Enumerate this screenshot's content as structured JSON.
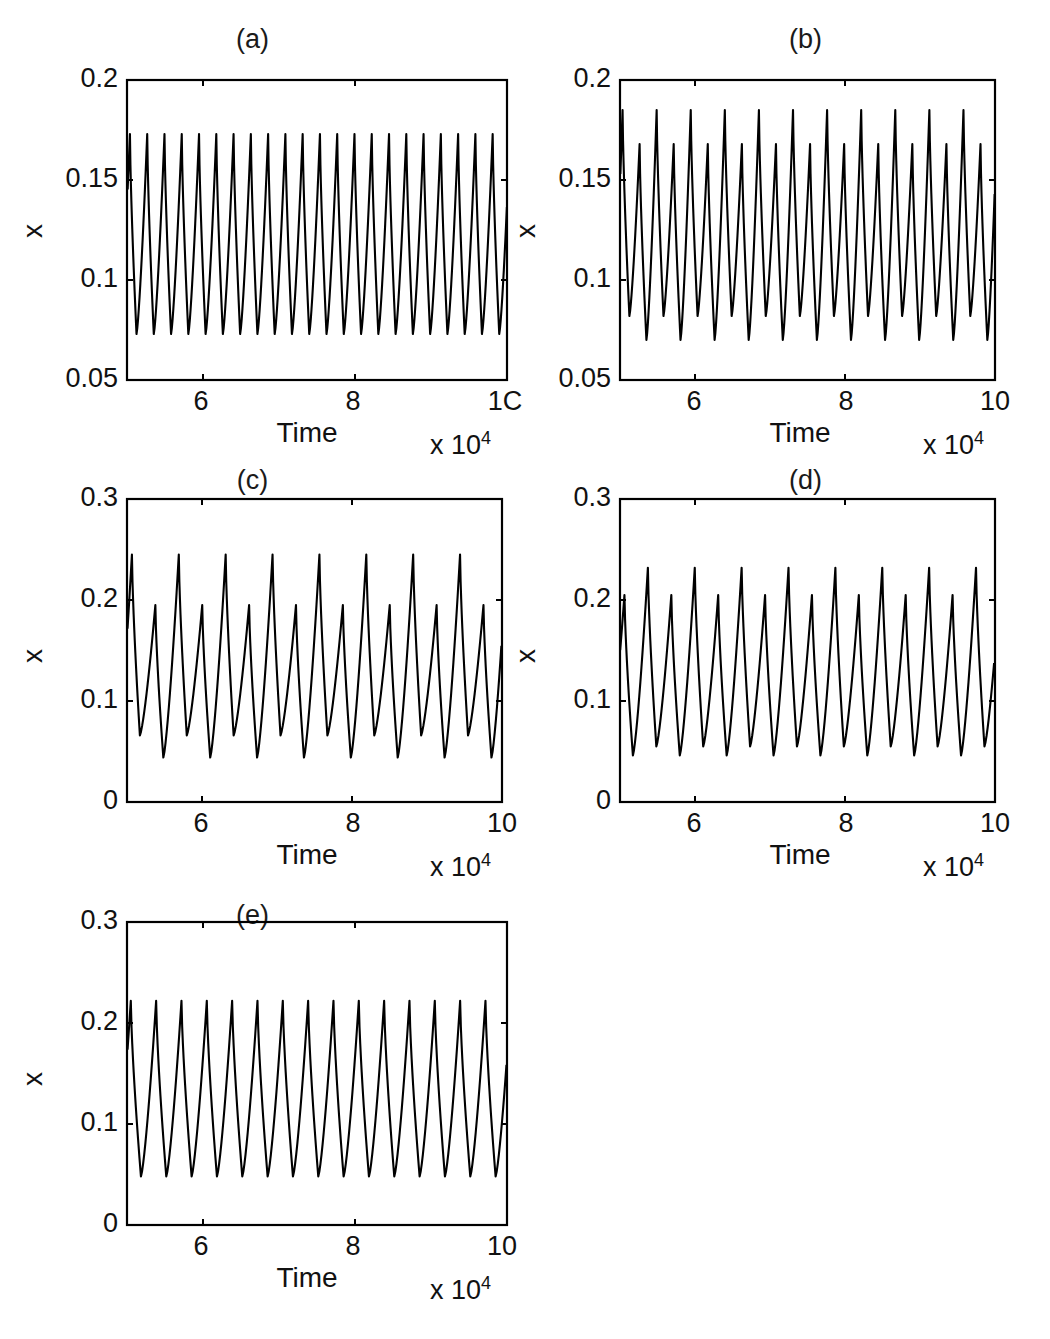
{
  "figure": {
    "background_color": "#ffffff",
    "line_color": "#000000",
    "axis_color": "#000000"
  },
  "panels": [
    {
      "id": "a",
      "title": "(a)",
      "xlabel": "Time",
      "ylabel": "x",
      "exponent_text": "x 10",
      "exponent_sup": "4",
      "xticks": [
        "6",
        "8",
        "1C"
      ],
      "yticks": [
        "0.2",
        "0.15",
        "0.1",
        "0.05"
      ]
    },
    {
      "id": "b",
      "title": "(b)",
      "xlabel": "Time",
      "ylabel": "x",
      "exponent_text": "x 10",
      "exponent_sup": "4",
      "xticks": [
        "6",
        "8",
        "10"
      ],
      "yticks": [
        "0.2",
        "0.15",
        "0.1",
        "0.05"
      ]
    },
    {
      "id": "c",
      "title": "(c)",
      "xlabel": "Time",
      "ylabel": "x",
      "exponent_text": "x 10",
      "exponent_sup": "4",
      "xticks": [
        "6",
        "8",
        "10"
      ],
      "yticks": [
        "0.3",
        "0.2",
        "0.1",
        "0"
      ]
    },
    {
      "id": "d",
      "title": "(d)",
      "xlabel": "Time",
      "ylabel": "x",
      "exponent_text": "x 10",
      "exponent_sup": "4",
      "xticks": [
        "6",
        "8",
        "10"
      ],
      "yticks": [
        "0.3",
        "0.2",
        "0.1",
        "0"
      ]
    },
    {
      "id": "e",
      "title": "(e)",
      "xlabel": "Time",
      "ylabel": "x",
      "exponent_text": "x 10",
      "exponent_sup": "4",
      "xticks": [
        "6",
        "8",
        "10"
      ],
      "yticks": [
        "0.3",
        "0.2",
        "0.1",
        "0"
      ]
    }
  ],
  "chart_data": [
    {
      "type": "line",
      "panel": "a",
      "title": "(a)",
      "xlabel": "Time",
      "ylabel": "x",
      "x_scale_exponent": 4,
      "xlim": [
        5,
        10
      ],
      "ylim": [
        0.05,
        0.2
      ],
      "xticks": [
        6,
        8,
        10
      ],
      "yticks": [
        0.05,
        0.1,
        0.15,
        0.2
      ],
      "grid": false,
      "legend": "none",
      "waveform": "periodic-relaxation",
      "periodicity": "period-1",
      "n_cycles": 22,
      "period_units": 0.2273,
      "peak_values": [
        0.173
      ],
      "trough_values": [
        0.073
      ],
      "rise_fraction": 0.62,
      "description": "Uniform period-1 relaxation oscillation, peaks 0.173, troughs 0.073"
    },
    {
      "type": "line",
      "panel": "b",
      "title": "(b)",
      "xlabel": "Time",
      "ylabel": "x",
      "x_scale_exponent": 4,
      "xlim": [
        5,
        10
      ],
      "ylim": [
        0.05,
        0.2
      ],
      "xticks": [
        6,
        8,
        10
      ],
      "yticks": [
        0.05,
        0.1,
        0.15,
        0.2
      ],
      "grid": false,
      "legend": "none",
      "waveform": "periodic-relaxation",
      "periodicity": "period-2",
      "n_cycles": 22,
      "period_units": 0.2273,
      "peak_values": [
        0.185,
        0.168
      ],
      "trough_values": [
        0.07,
        0.082
      ],
      "rise_fraction": 0.6,
      "description": "Period-2 alternation: tall peaks 0.185, short peaks 0.168"
    },
    {
      "type": "line",
      "panel": "c",
      "title": "(c)",
      "xlabel": "Time",
      "ylabel": "x",
      "x_scale_exponent": 4,
      "xlim": [
        5,
        10
      ],
      "ylim": [
        0,
        0.3
      ],
      "xticks": [
        6,
        8,
        10
      ],
      "yticks": [
        0,
        0.1,
        0.2,
        0.3
      ],
      "grid": false,
      "legend": "none",
      "waveform": "periodic-relaxation",
      "periodicity": "period-2",
      "n_cycles": 16,
      "period_units": 0.3125,
      "peak_values": [
        0.245,
        0.195
      ],
      "trough_values": [
        0.044,
        0.066
      ],
      "rise_fraction": 0.66,
      "description": "Strong period-2 alternation: tall peaks 0.245, short peaks 0.195"
    },
    {
      "type": "line",
      "panel": "d",
      "title": "(d)",
      "xlabel": "Time",
      "ylabel": "x",
      "x_scale_exponent": 4,
      "xlim": [
        5,
        10
      ],
      "ylim": [
        0,
        0.3
      ],
      "xticks": [
        6,
        8,
        10
      ],
      "yticks": [
        0,
        0.1,
        0.2,
        0.3
      ],
      "grid": false,
      "legend": "none",
      "waveform": "periodic-relaxation",
      "periodicity": "period-2",
      "n_cycles": 16,
      "period_units": 0.3125,
      "peak_values": [
        0.205,
        0.232
      ],
      "trough_values": [
        0.055,
        0.046
      ],
      "rise_fraction": 0.64,
      "description": "Period-2 alternation: short peaks 0.205, tall peaks 0.232"
    },
    {
      "type": "line",
      "panel": "e",
      "title": "(e)",
      "xlabel": "Time",
      "ylabel": "x",
      "x_scale_exponent": 4,
      "xlim": [
        5,
        10
      ],
      "ylim": [
        0,
        0.3
      ],
      "xticks": [
        6,
        8,
        10
      ],
      "yticks": [
        0,
        0.1,
        0.2,
        0.3
      ],
      "grid": false,
      "legend": "none",
      "waveform": "periodic-relaxation",
      "periodicity": "period-1",
      "n_cycles": 15,
      "period_units": 0.3333,
      "peak_values": [
        0.222
      ],
      "trough_values": [
        0.048
      ],
      "rise_fraction": 0.6,
      "description": "Uniform period-1 relaxation oscillation, peaks 0.222, troughs 0.048"
    }
  ]
}
